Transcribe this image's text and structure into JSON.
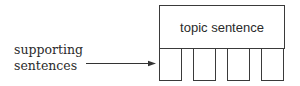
{
  "diagram": {
    "topic_box": {
      "label": "topic sentence"
    },
    "side_label": {
      "line1": "supporting",
      "line2": "sentences"
    },
    "legs": [
      {
        "name": "supporting-sentence-1"
      },
      {
        "name": "supporting-sentence-2"
      },
      {
        "name": "supporting-sentence-3"
      },
      {
        "name": "supporting-sentence-4"
      }
    ],
    "colors": {
      "stroke": "#3a3a3a",
      "text": "#2a2a2a",
      "background": "#ffffff"
    }
  }
}
